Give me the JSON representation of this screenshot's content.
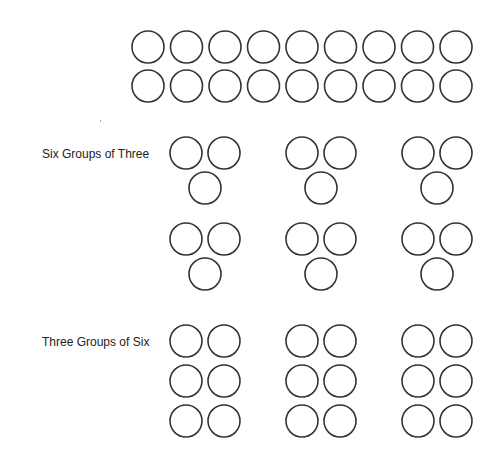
{
  "diagram": {
    "stroke_color": "#333333",
    "circle_radius": 16,
    "top_array": {
      "description": "2 rows of 9 circles (18 total)",
      "rows": 2,
      "columns": 9
    },
    "sections": [
      {
        "label": "Six Groups of Three",
        "groups": 6,
        "items_per_group": 3,
        "arrangement": "triangle (2 on top, 1 below)"
      },
      {
        "label": "Three Groups of Six",
        "groups": 3,
        "items_per_group": 6,
        "arrangement": "3 rows of 2"
      }
    ]
  }
}
